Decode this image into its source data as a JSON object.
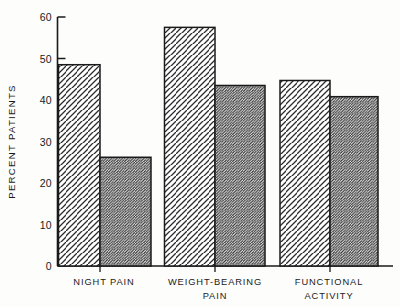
{
  "chart_data": {
    "type": "bar",
    "title": "",
    "xlabel": "",
    "ylabel": "PERCENT PATIENTS",
    "ylim": [
      0,
      60
    ],
    "yticks": [
      0,
      10,
      20,
      30,
      40,
      50,
      60
    ],
    "ytick_labels": [
      "0",
      "10",
      "20",
      "30",
      "40",
      "50",
      "60"
    ],
    "grid": false,
    "legend": "none",
    "categories": [
      "NIGHT PAIN",
      "WEIGHT-BEARING PAIN",
      "FUNCTIONAL ACTIVITY"
    ],
    "category_lines": [
      [
        "NIGHT PAIN"
      ],
      [
        "WEIGHT-BEARING",
        "PAIN"
      ],
      [
        "FUNCTIONAL",
        "ACTIVITY"
      ]
    ],
    "series": [
      {
        "name": "series-1",
        "hatch": "wide-diagonal",
        "values": [
          48.5,
          57.5,
          44.7
        ]
      },
      {
        "name": "series-2",
        "hatch": "dense-diagonal",
        "values": [
          26.2,
          43.5,
          40.8
        ]
      }
    ],
    "bars": [
      {
        "group": "NIGHT PAIN",
        "series": "series-1",
        "value": 48.5
      },
      {
        "group": "NIGHT PAIN",
        "series": "series-2",
        "value": 26.2
      },
      {
        "group": "WEIGHT-BEARING PAIN",
        "series": "series-1",
        "value": 57.5
      },
      {
        "group": "WEIGHT-BEARING PAIN",
        "series": "series-2",
        "value": 43.5
      },
      {
        "group": "FUNCTIONAL ACTIVITY",
        "series": "series-1",
        "value": 44.7
      },
      {
        "group": "FUNCTIONAL ACTIVITY",
        "series": "series-2",
        "value": 40.8
      }
    ],
    "colors": {
      "ink": "#1a1a1a",
      "background": "#fdfdfb",
      "bar_fill": "#ffffff",
      "hatch": "#2b2b2b"
    }
  },
  "yticks": {
    "t0": "0",
    "t10": "10",
    "t20": "20",
    "t30": "30",
    "t40": "40",
    "t50": "50",
    "t60": "60"
  },
  "axis": {
    "ylabel": "PERCENT PATIENTS"
  },
  "categories": {
    "g1_l1": "NIGHT PAIN",
    "g2_l1": "WEIGHT-BEARING",
    "g2_l2": "PAIN",
    "g3_l1": "FUNCTIONAL",
    "g3_l2": "ACTIVITY"
  }
}
